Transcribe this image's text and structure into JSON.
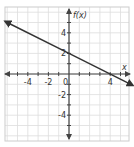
{
  "chart_data": {
    "type": "line",
    "title": "",
    "xlabel": "x",
    "ylabel": "f(x)",
    "xlim": [
      -6.2,
      6.2
    ],
    "ylim": [
      -6.5,
      6.4
    ],
    "grid": true,
    "grid_step": 1,
    "x_tick_labels": [
      {
        "value": -4,
        "label": "-4"
      },
      {
        "value": -2,
        "label": "-2"
      },
      {
        "value": 0,
        "label": "0"
      },
      {
        "value": 4,
        "label": "4"
      }
    ],
    "y_tick_labels": [
      {
        "value": 4,
        "label": "4"
      },
      {
        "value": 2,
        "label": "2"
      },
      {
        "value": -2,
        "label": "-2"
      },
      {
        "value": -4,
        "label": "-4"
      }
    ],
    "series": [
      {
        "name": "f(x)",
        "equation": "f(x) = -0.5x + 2",
        "points": [
          [
            -6,
            5
          ],
          [
            0,
            2
          ],
          [
            4,
            0
          ],
          [
            6,
            -1
          ]
        ],
        "arrows": "both",
        "color": "#333333"
      }
    ]
  },
  "style": {
    "grid_color": "#dddddd",
    "axis_color": "#444444",
    "line_color": "#333333",
    "border_color": "#cccccc"
  }
}
